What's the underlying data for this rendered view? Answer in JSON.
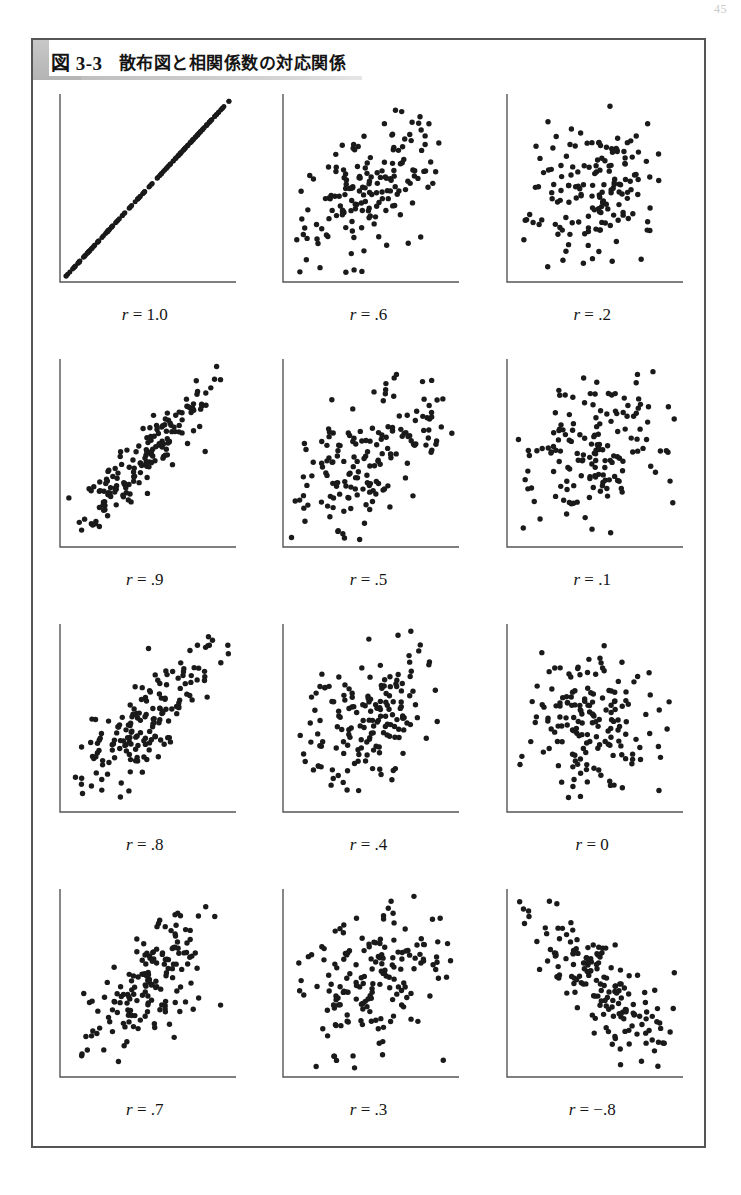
{
  "page": {
    "number": "45"
  },
  "figure": {
    "number": "図 3-3",
    "caption": "散布図と相関係数の対応関係",
    "banner_color": "#bdbdbd",
    "border_color": "#555555",
    "point_color": "#1a1a1a",
    "axis_color": "#555555"
  },
  "chart_data": {
    "type": "scatter",
    "title": "散布図と相関係数の対応関係",
    "xlabel": "",
    "ylabel": "",
    "grid": false,
    "legend": "none",
    "axes_style": "L-shaped spine, no ticks, no tick labels",
    "n_points_per_panel": 170,
    "layout": {
      "rows": 4,
      "cols": 3,
      "order": "row-major"
    },
    "panels": [
      {
        "label": "r = 1.0",
        "r": 1.0,
        "label_prefix": "r",
        "label_value": "1.0",
        "seed": 11
      },
      {
        "label": "r = .6",
        "r": 0.6,
        "label_prefix": "r",
        "label_value": ".6",
        "seed": 22
      },
      {
        "label": "r = .2",
        "r": 0.2,
        "label_prefix": "r",
        "label_value": ".2",
        "seed": 33
      },
      {
        "label": "r = .9",
        "r": 0.9,
        "label_prefix": "r",
        "label_value": ".9",
        "seed": 44
      },
      {
        "label": "r = .5",
        "r": 0.5,
        "label_prefix": "r",
        "label_value": ".5",
        "seed": 55
      },
      {
        "label": "r = .1",
        "r": 0.1,
        "label_prefix": "r",
        "label_value": ".1",
        "seed": 66
      },
      {
        "label": "r = .8",
        "r": 0.8,
        "label_prefix": "r",
        "label_value": ".8",
        "seed": 77
      },
      {
        "label": "r = .4",
        "r": 0.4,
        "label_prefix": "r",
        "label_value": ".4",
        "seed": 88
      },
      {
        "label": "r = 0",
        "r": 0.0,
        "label_prefix": "r",
        "label_value": "0",
        "seed": 99
      },
      {
        "label": "r = .7",
        "r": 0.7,
        "label_prefix": "r",
        "label_value": ".7",
        "seed": 111
      },
      {
        "label": "r = .3",
        "r": 0.3,
        "label_prefix": "r",
        "label_value": ".3",
        "seed": 122
      },
      {
        "label": "r = −.8",
        "r": -0.8,
        "label_prefix": "r",
        "label_value": "−.8",
        "seed": 133
      }
    ]
  }
}
